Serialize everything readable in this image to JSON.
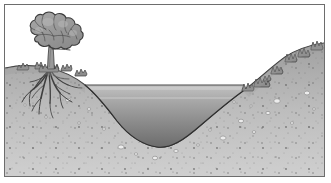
{
  "illustration": {
    "title": "Cross-section of a pond with tree on bank",
    "style": "grayscale line drawing",
    "frame": {
      "border_color": "#6d6d6d",
      "margin_color": "#ffffff"
    },
    "sky": {
      "label": "sky",
      "color": "#ffffff"
    },
    "water": {
      "label": "pond water",
      "surface_label": "water surface line",
      "surface_color": "#5a5a5a",
      "color_top": "#b9b9b9",
      "color_bottom": "#6f6f6f"
    },
    "soil": {
      "label": "soil / substrate",
      "color_top": "#a8a8a8",
      "color_bottom": "#c8c8c8",
      "outline_color": "#3a3a3a",
      "speckle_color": "#5e5e5e",
      "pebble_color": "#e8e8e8",
      "pebble_outline": "#6a6a6a"
    },
    "tree": {
      "label": "tree",
      "canopy_color": "#9a9a9a",
      "canopy_outline": "#3c3c3c",
      "trunk_color": "#8e8e8e",
      "trunk_outline": "#3c3c3c",
      "roots_label": "root system",
      "root_color": "#4a4a4a"
    },
    "shrubs": {
      "label": "bank shrubs",
      "color": "#8d8d8d",
      "outline": "#3c3c3c"
    }
  }
}
